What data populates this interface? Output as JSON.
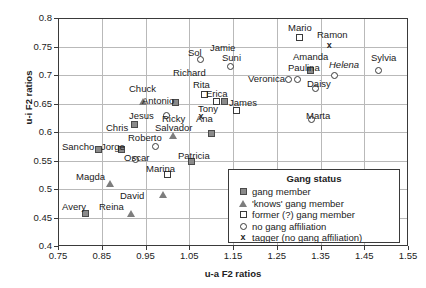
{
  "chart_data": {
    "type": "scatter",
    "title": "",
    "xlabel": "u-a F2 ratios",
    "ylabel": "u-i F2 ratios",
    "xlim": [
      0.75,
      1.55
    ],
    "ylim": [
      0.4,
      0.8
    ],
    "xticks": [
      "0.75",
      "0.85",
      "0.95",
      "1.05",
      "1.15",
      "1.25",
      "1.35",
      "1.45",
      "1.55"
    ],
    "yticks": [
      "0.4",
      "0.45",
      "0.5",
      "0.55",
      "0.6",
      "0.65",
      "0.7",
      "0.75",
      "0.8"
    ],
    "grid": true,
    "legend_position": "inside-bottom-right",
    "legend_title": "Gang status",
    "series": [
      {
        "name": "gang member",
        "marker": "filled-square",
        "points": [
          {
            "label": "Antonio",
            "x": 1.018,
            "y": 0.652,
            "lx": -24,
            "ly": -11
          },
          {
            "label": "Chris",
            "x": 0.925,
            "y": 0.613,
            "lx": -26,
            "ly": -11
          },
          {
            "label": "Sancho",
            "x": 0.842,
            "y": 0.57,
            "lx": -40,
            "ly": -10
          },
          {
            "label": "Jorge",
            "x": 0.895,
            "y": 0.57,
            "lx": -11,
            "ly": -11
          },
          {
            "label": "Salvador",
            "x": 1.1,
            "y": 0.597,
            "lx": -49,
            "ly": -11
          },
          {
            "label": "Patricia",
            "x": 1.055,
            "y": 0.548,
            "lx": -12,
            "ly": -12
          },
          {
            "label": "Avery",
            "x": 0.812,
            "y": 0.457,
            "lx": -30,
            "ly": -11
          },
          {
            "label": "Paulina",
            "x": 1.327,
            "y": 0.708,
            "lx": -41,
            "ly": -3
          },
          {
            "label": "Amanda",
            "x": 1.327,
            "y": 0.708,
            "lx": -26,
            "ly": -13
          }
        ]
      },
      {
        "name": "'knows' gang member",
        "marker": "triangle",
        "points": [
          {
            "label": "Chuck",
            "x": 0.945,
            "y": 0.653,
            "lx": -14,
            "ly": -12
          },
          {
            "label": "Roberto",
            "x": 1.015,
            "y": 0.593,
            "lx": -47,
            "ly": -6
          },
          {
            "label": "Magda",
            "x": 0.87,
            "y": 0.509,
            "lx": -18,
            "ly": -12
          },
          {
            "label": "Reina",
            "x": 0.918,
            "y": 0.457,
            "lx": -30,
            "ly": -10
          },
          {
            "label": "David",
            "x": 0.992,
            "y": 0.489,
            "lx": -28,
            "ly": -12
          }
        ]
      },
      {
        "name": "former (?) gang member",
        "marker": "open-square",
        "points": [
          {
            "label": "Mario",
            "x": 1.303,
            "y": 0.765,
            "lx": -14,
            "ly": -12
          },
          {
            "label": "Rita",
            "x": 1.085,
            "y": 0.665,
            "lx": -6,
            "ly": -12
          },
          {
            "label": "Erica",
            "x": 1.113,
            "y": 0.654,
            "lx": 2,
            "ly": -11
          },
          {
            "label": "Tony",
            "x": 1.14,
            "y": 0.638,
            "lx": -32,
            "ly": -9
          },
          {
            "label": "Marina",
            "x": 1.0,
            "y": 0.525,
            "lx": -12,
            "ly": -13
          }
        ]
      },
      {
        "name": "no gang affiliation",
        "marker": "circle",
        "points": [
          {
            "label": "Sol",
            "x": 1.075,
            "y": 0.728,
            "lx": -21,
            "ly": -11
          },
          {
            "label": "Jamie",
            "x": 1.145,
            "y": 0.728,
            "lx": -4,
            "ly": -19
          },
          {
            "label": "Suni",
            "x": 1.145,
            "y": 0.715,
            "lx": -2,
            "ly": -12
          },
          {
            "label": "Richard",
            "x": 1.075,
            "y": 0.715,
            "lx": -46,
            "ly": -5
          },
          {
            "label": "Veronica",
            "x": 1.277,
            "y": 0.692,
            "lx": -53,
            "ly": -6
          },
          {
            "label": "Veronica2",
            "x": 1.295,
            "y": 0.692,
            "lx": 0,
            "ly": 0,
            "nolabel": true
          },
          {
            "label": "Daisy",
            "x": 1.338,
            "y": 0.676,
            "lx": -5,
            "ly": -12
          },
          {
            "label": "Helena",
            "x": 1.383,
            "y": 0.7,
            "lx": -3,
            "ly": -12,
            "italic": true
          },
          {
            "label": "Sylvia",
            "x": 1.483,
            "y": 0.708,
            "lx": -12,
            "ly": -13
          },
          {
            "label": "Marta",
            "x": 1.33,
            "y": 0.622,
            "lx": -14,
            "ly": -13
          },
          {
            "label": "Jesus",
            "x": 0.988,
            "y": 0.629,
            "lx": -32,
            "ly": -6
          },
          {
            "label": "Oscar",
            "x": 0.958,
            "y": 0.552,
            "lx": -4,
            "ly": -12
          },
          {
            "label": "Roberto2",
            "x": 1.015,
            "y": 0.573,
            "lx": 0,
            "ly": 0,
            "nolabel": true
          }
        ]
      },
      {
        "name": "tagger (no gang affiliation)",
        "marker": "cross",
        "points": [
          {
            "label": "Ramon",
            "x": 1.37,
            "y": 0.752,
            "lx": -6,
            "ly": -13
          },
          {
            "label": "Ana",
            "x": 1.073,
            "y": 0.628,
            "lx": 8,
            "ly": -5
          },
          {
            "label": "Ricky",
            "x": 1.073,
            "y": 0.628,
            "lx": -36,
            "ly": -5
          },
          {
            "label": "James",
            "x": 1.127,
            "y": 0.654,
            "lx": 10,
            "ly": -6
          }
        ]
      }
    ],
    "legend_entries": [
      {
        "symbol": "filled-square",
        "label": "gang member"
      },
      {
        "symbol": "triangle",
        "label": "'knows' gang member"
      },
      {
        "symbol": "open-square",
        "label": "former (?) gang member"
      },
      {
        "symbol": "circle",
        "label": "no gang affiliation"
      },
      {
        "symbol": "cross",
        "label": "tagger (no gang affiliation)"
      }
    ]
  },
  "markers": [
    {
      "name": "mario",
      "type": "open-square",
      "x": 1.303,
      "y": 0.765
    },
    {
      "name": "ramon",
      "type": "cross",
      "x": 1.37,
      "y": 0.752
    },
    {
      "name": "sol",
      "type": "circle",
      "x": 1.075,
      "y": 0.728
    },
    {
      "name": "suni",
      "type": "circle",
      "x": 1.145,
      "y": 0.715
    },
    {
      "name": "amanda",
      "type": "filled-square",
      "x": 1.327,
      "y": 0.708
    },
    {
      "name": "helena",
      "type": "circle",
      "x": 1.383,
      "y": 0.7
    },
    {
      "name": "sylvia",
      "type": "circle",
      "x": 1.483,
      "y": 0.708
    },
    {
      "name": "veronica1",
      "type": "circle",
      "x": 1.277,
      "y": 0.692
    },
    {
      "name": "veronica2",
      "type": "circle",
      "x": 1.297,
      "y": 0.692
    },
    {
      "name": "daisy",
      "type": "circle",
      "x": 1.338,
      "y": 0.676
    },
    {
      "name": "rita",
      "type": "open-square",
      "x": 1.085,
      "y": 0.665
    },
    {
      "name": "erica",
      "type": "open-square",
      "x": 1.113,
      "y": 0.654
    },
    {
      "name": "james",
      "type": "filled-square",
      "x": 1.131,
      "y": 0.654
    },
    {
      "name": "chuck",
      "type": "triangle",
      "x": 0.945,
      "y": 0.653
    },
    {
      "name": "antonio",
      "type": "filled-square",
      "x": 1.018,
      "y": 0.652
    },
    {
      "name": "tony",
      "type": "open-square",
      "x": 1.158,
      "y": 0.637
    },
    {
      "name": "jesus",
      "type": "circle",
      "x": 0.997,
      "y": 0.629
    },
    {
      "name": "ana",
      "type": "cross",
      "x": 1.077,
      "y": 0.628
    },
    {
      "name": "marta",
      "type": "circle",
      "x": 1.33,
      "y": 0.622
    },
    {
      "name": "chris",
      "type": "filled-square",
      "x": 0.925,
      "y": 0.613
    },
    {
      "name": "salvador",
      "type": "filled-square",
      "x": 1.1,
      "y": 0.597
    },
    {
      "name": "roberto",
      "type": "triangle",
      "x": 1.015,
      "y": 0.593
    },
    {
      "name": "robertoc",
      "type": "circle",
      "x": 0.972,
      "y": 0.575
    },
    {
      "name": "sancho",
      "type": "filled-square",
      "x": 0.842,
      "y": 0.57
    },
    {
      "name": "jorge",
      "type": "filled-square",
      "x": 0.895,
      "y": 0.57
    },
    {
      "name": "oscar",
      "type": "circle",
      "x": 0.928,
      "y": 0.552
    },
    {
      "name": "patricia",
      "type": "filled-square",
      "x": 1.055,
      "y": 0.548
    },
    {
      "name": "marina",
      "type": "open-square",
      "x": 1.0,
      "y": 0.525
    },
    {
      "name": "magda",
      "type": "triangle",
      "x": 0.87,
      "y": 0.509
    },
    {
      "name": "david",
      "type": "triangle",
      "x": 0.992,
      "y": 0.489
    },
    {
      "name": "avery",
      "type": "filled-square",
      "x": 0.812,
      "y": 0.457
    },
    {
      "name": "reina",
      "type": "triangle",
      "x": 0.918,
      "y": 0.457
    }
  ],
  "labels": [
    {
      "name": "mario",
      "text": "Mario",
      "x": 288,
      "y": 22,
      "italic": false
    },
    {
      "name": "ramon",
      "text": "Ramon",
      "x": 317,
      "y": 29,
      "italic": false
    },
    {
      "name": "sol",
      "text": "Sol",
      "x": 188,
      "y": 47,
      "italic": false
    },
    {
      "name": "jamie",
      "text": "Jamie",
      "x": 210,
      "y": 42,
      "italic": false
    },
    {
      "name": "suni",
      "text": "Suni",
      "x": 222,
      "y": 52,
      "italic": false
    },
    {
      "name": "amanda",
      "text": "Amanda",
      "x": 293,
      "y": 51,
      "italic": false
    },
    {
      "name": "sylvia",
      "text": "Sylvia",
      "x": 371,
      "y": 52,
      "italic": false
    },
    {
      "name": "helena",
      "text": "Helena",
      "x": 329,
      "y": 59,
      "italic": true
    },
    {
      "name": "paulina",
      "text": "Paulina",
      "x": 288,
      "y": 62,
      "italic": false
    },
    {
      "name": "richard",
      "text": "Richard",
      "x": 173,
      "y": 67,
      "italic": false
    },
    {
      "name": "veronica",
      "text": "Veronica",
      "x": 248,
      "y": 73,
      "italic": false
    },
    {
      "name": "daisy",
      "text": "Daisy",
      "x": 307,
      "y": 78,
      "italic": false
    },
    {
      "name": "rita",
      "text": "Rita",
      "x": 193,
      "y": 79,
      "italic": false
    },
    {
      "name": "erica",
      "text": "Erica",
      "x": 206,
      "y": 88,
      "italic": false
    },
    {
      "name": "chuck",
      "text": "Chuck",
      "x": 129,
      "y": 83,
      "italic": false
    },
    {
      "name": "james",
      "text": "James",
      "x": 229,
      "y": 97,
      "italic": false
    },
    {
      "name": "antonio",
      "text": "Antonio",
      "x": 142,
      "y": 95,
      "italic": false
    },
    {
      "name": "tony",
      "text": "Tony",
      "x": 198,
      "y": 103,
      "italic": false
    },
    {
      "name": "jesus",
      "text": "Jesus",
      "x": 129,
      "y": 110,
      "italic": false
    },
    {
      "name": "ricky",
      "text": "Ricky",
      "x": 162,
      "y": 113,
      "italic": false
    },
    {
      "name": "ana",
      "text": "Ana",
      "x": 196,
      "y": 113,
      "italic": false
    },
    {
      "name": "marta",
      "text": "Marta",
      "x": 306,
      "y": 110,
      "italic": false
    },
    {
      "name": "chris",
      "text": "Chris",
      "x": 106,
      "y": 122,
      "italic": false
    },
    {
      "name": "salvador",
      "text": "Salvador",
      "x": 155,
      "y": 122,
      "italic": false
    },
    {
      "name": "sancho",
      "text": "Sancho",
      "x": 62,
      "y": 141,
      "italic": false
    },
    {
      "name": "roberto",
      "text": "Roberto",
      "x": 128,
      "y": 132,
      "italic": false
    },
    {
      "name": "jorge",
      "text": "Jorge",
      "x": 101,
      "y": 141,
      "italic": false
    },
    {
      "name": "oscar",
      "text": "Oscar",
      "x": 124,
      "y": 152,
      "italic": false
    },
    {
      "name": "patricia",
      "text": "Patricia",
      "x": 178,
      "y": 150,
      "italic": false
    },
    {
      "name": "marina",
      "text": "Marina",
      "x": 146,
      "y": 163,
      "italic": false
    },
    {
      "name": "magda",
      "text": "Magda",
      "x": 76,
      "y": 171,
      "italic": false
    },
    {
      "name": "david",
      "text": "David",
      "x": 120,
      "y": 190,
      "italic": false
    },
    {
      "name": "avery",
      "text": "Avery",
      "x": 62,
      "y": 201,
      "italic": false
    },
    {
      "name": "reina",
      "text": "Reina",
      "x": 99,
      "y": 201,
      "italic": false
    }
  ]
}
